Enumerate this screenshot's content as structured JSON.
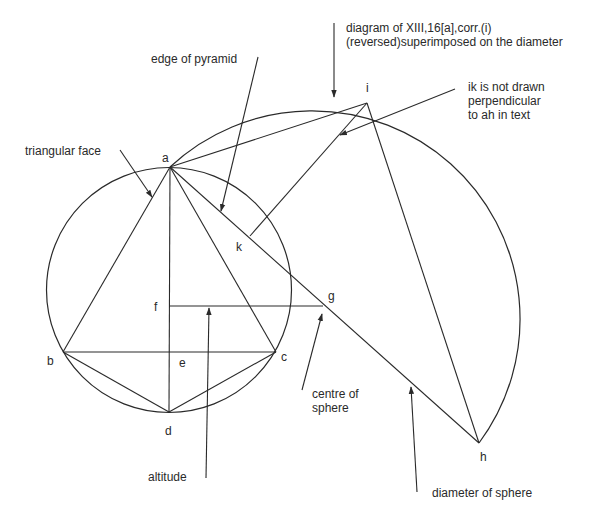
{
  "figure": {
    "type": "geometric construction"
  },
  "points": {
    "a": {
      "label": "a",
      "x": 170,
      "y": 167
    },
    "b": {
      "label": "b",
      "x": 63,
      "y": 352
    },
    "c": {
      "label": "c",
      "x": 276,
      "y": 352
    },
    "d": {
      "label": "d",
      "x": 169,
      "y": 412
    },
    "e": {
      "label": "e",
      "x": 169,
      "y": 352
    },
    "f": {
      "label": "f",
      "x": 169,
      "y": 306
    },
    "g": {
      "label": "g",
      "x": 323,
      "y": 306
    },
    "h": {
      "label": "h",
      "x": 479,
      "y": 443
    },
    "i": {
      "label": "i",
      "x": 367,
      "y": 103
    },
    "k": {
      "label": "k",
      "x": 250,
      "y": 236
    }
  },
  "circles": {
    "small": {
      "cx": 169,
      "cy": 290,
      "r": 122.5
    },
    "large_arc": {
      "cx": 323,
      "cy": 305,
      "r": 208,
      "from": "a",
      "to": "h",
      "through": "i"
    }
  },
  "annotations": {
    "diagram_note": {
      "lines": [
        "diagram of XIII,16[a],corr.(i)",
        "(reversed)superimposed on the diameter"
      ]
    },
    "edge_of_pyramid": {
      "lines": [
        "edge of pyramid"
      ]
    },
    "ik_note": {
      "lines": [
        "ik is not drawn",
        "perpendicular",
        "to ah in text"
      ]
    },
    "triangular_face": {
      "lines": [
        "triangular face"
      ]
    },
    "centre_of_sphere": {
      "lines": [
        "centre of",
        "sphere"
      ]
    },
    "altitude": {
      "lines": [
        "altitude"
      ]
    },
    "diameter_of_sphere": {
      "lines": [
        "diameter of sphere"
      ]
    }
  },
  "colors": {
    "ink": "#2a2a2a",
    "background": "#ffffff"
  }
}
